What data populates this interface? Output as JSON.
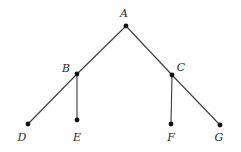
{
  "diagram": {
    "type": "tree",
    "nodes": [
      {
        "id": "A",
        "label": "A",
        "x": 126,
        "y": 26,
        "lx": 124,
        "ly": 17
      },
      {
        "id": "B",
        "label": "B",
        "x": 77,
        "y": 74,
        "lx": 66,
        "ly": 72
      },
      {
        "id": "C",
        "label": "C",
        "x": 172,
        "y": 75,
        "lx": 181,
        "ly": 71
      },
      {
        "id": "D",
        "label": "D",
        "x": 28,
        "y": 124,
        "lx": 22,
        "ly": 141
      },
      {
        "id": "E",
        "label": "E",
        "x": 77,
        "y": 120,
        "lx": 77,
        "ly": 141
      },
      {
        "id": "F",
        "label": "F",
        "x": 171,
        "y": 124,
        "lx": 171,
        "ly": 141
      },
      {
        "id": "G",
        "label": "G",
        "x": 220,
        "y": 125,
        "lx": 219,
        "ly": 141
      }
    ],
    "edges": [
      {
        "from": "A",
        "to": "B"
      },
      {
        "from": "A",
        "to": "C"
      },
      {
        "from": "B",
        "to": "D"
      },
      {
        "from": "B",
        "to": "E"
      },
      {
        "from": "C",
        "to": "F"
      },
      {
        "from": "C",
        "to": "G"
      }
    ]
  }
}
